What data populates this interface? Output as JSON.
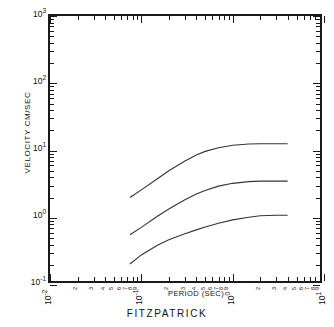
{
  "caption": "FITZPATRICK",
  "chart_data": {
    "type": "line",
    "title": "",
    "xlabel": "PERIOD (SEC)",
    "ylabel": "VELOCITY CM/SEC",
    "xscale": "log",
    "yscale": "log",
    "xlim": [
      0.01,
      10
    ],
    "ylim": [
      0.1,
      1000
    ],
    "grid": false,
    "legend": "none",
    "x_major_ticks": [
      "10-2",
      "10-1",
      "100",
      "101"
    ],
    "x_major_tick_labels": [
      "10",
      "10",
      "10",
      "10"
    ],
    "x_major_tick_exponents": [
      "-2",
      "-1",
      "0",
      "1"
    ],
    "x_minor_tick_labels": [
      "2",
      "3",
      "4",
      "5",
      "6",
      "7",
      "8",
      "9"
    ],
    "y_major_tick_labels": [
      "10",
      "10",
      "10",
      "10",
      "10"
    ],
    "y_major_tick_exponents": [
      "3",
      "2",
      "1",
      "0",
      "-1"
    ],
    "y_major_tick_values": [
      1000,
      100,
      10,
      1,
      0.1
    ],
    "series": [
      {
        "name": "upper",
        "x": [
          0.075,
          0.1,
          0.15,
          0.2,
          0.3,
          0.4,
          0.5,
          0.7,
          1.0,
          1.5,
          2.0,
          3.0,
          4.0
        ],
        "y": [
          2.0,
          2.6,
          3.8,
          5.0,
          7.0,
          8.6,
          9.7,
          11.0,
          12.0,
          12.5,
          12.6,
          12.6,
          12.6
        ]
      },
      {
        "name": "middle",
        "x": [
          0.075,
          0.1,
          0.15,
          0.2,
          0.3,
          0.4,
          0.5,
          0.7,
          1.0,
          1.5,
          2.0,
          3.0,
          4.0
        ],
        "y": [
          0.56,
          0.72,
          1.05,
          1.35,
          1.85,
          2.25,
          2.55,
          2.95,
          3.25,
          3.45,
          3.5,
          3.5,
          3.5
        ]
      },
      {
        "name": "lower",
        "x": [
          0.075,
          0.1,
          0.15,
          0.2,
          0.3,
          0.4,
          0.5,
          0.7,
          1.0,
          1.5,
          2.0,
          3.0,
          4.0
        ],
        "y": [
          0.205,
          0.28,
          0.39,
          0.47,
          0.58,
          0.66,
          0.73,
          0.83,
          0.93,
          1.02,
          1.07,
          1.09,
          1.09
        ]
      }
    ]
  },
  "colors": {
    "axis": "#1a1a1a",
    "curve": "#333333",
    "background": "#ffffff"
  }
}
